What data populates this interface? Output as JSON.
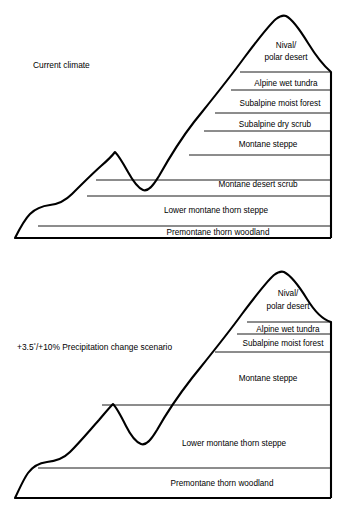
{
  "figure": {
    "type": "schematic-diagram",
    "background_color": "#ffffff",
    "line_color": "#000000",
    "panel_count": 2
  },
  "panels": [
    {
      "id": "current-climate",
      "caption": "Current climate",
      "caption_pos": {
        "x": 33,
        "y": 68
      },
      "peak": {
        "x": 286,
        "y": 16
      },
      "base_y": 238,
      "left_x": 15,
      "right_x": 331,
      "zones": [
        {
          "label": "Nival/",
          "label2": "polar desert",
          "y_top": 16,
          "y_bottom": 72,
          "label_x": 286,
          "label_y": 48,
          "centered": true
        },
        {
          "label": "Alpine wet tundra",
          "y_top": 72,
          "y_bottom": 90,
          "label_x": 286,
          "label_y": 85,
          "centered": true
        },
        {
          "label": "Subalpine moist forest",
          "y_top": 90,
          "y_bottom": 113,
          "label_x": 280,
          "label_y": 105,
          "centered": true
        },
        {
          "label": "Subalpine dry scrub",
          "y_top": 113,
          "y_bottom": 131,
          "label_x": 275,
          "label_y": 126,
          "centered": true
        },
        {
          "label": "Montane steppe",
          "y_top": 131,
          "y_bottom": 155,
          "label_x": 268,
          "label_y": 148,
          "centered": true
        },
        {
          "label": "Montane desert scrub",
          "y_top": 155,
          "y_bottom": 180,
          "label_x": 258,
          "label_y": 186,
          "centered": true
        },
        {
          "label": "Lower montane thorn steppe",
          "y_top": 180,
          "y_bottom": 209,
          "label_x": 220,
          "label_y": 213,
          "centered": true
        },
        {
          "label": "Premontane thorn woodland",
          "y_top": 209,
          "y_bottom": 238,
          "label_x": 220,
          "label_y": 235,
          "centered": true
        }
      ]
    },
    {
      "id": "change-scenario",
      "caption": "+3.5°/+10% Precipitation change scenario",
      "caption_prefix": "+3.5",
      "caption_degree": "°",
      "caption_suffix": "/+10% Precipitation change scenario",
      "caption_pos": {
        "x": 17,
        "y": 350
      },
      "peak": {
        "x": 286,
        "y": 273
      },
      "base_y": 498,
      "left_x": 15,
      "right_x": 331,
      "zones": [
        {
          "label": "Nival/",
          "label2": "polar desert",
          "y_top": 273,
          "y_bottom": 322,
          "label_x": 288,
          "label_y": 303,
          "centered": true
        },
        {
          "label": "Alpine wet tundra",
          "y_top": 322,
          "y_bottom": 334,
          "label_x": 288,
          "label_y": 332,
          "centered": true
        },
        {
          "label": "Subalpine moist forest",
          "y_top": 334,
          "y_bottom": 352,
          "label_x": 283,
          "label_y": 347,
          "centered": true
        },
        {
          "label": "Montane steppe",
          "y_top": 352,
          "y_bottom": 405,
          "label_x": 268,
          "label_y": 381,
          "centered": true
        },
        {
          "label": "Lower montane thorn steppe",
          "y_top": 405,
          "y_bottom": 468,
          "label_x": 238,
          "label_y": 446,
          "centered": true
        },
        {
          "label": "Premontane thorn woodland",
          "y_top": 468,
          "y_bottom": 498,
          "label_x": 225,
          "label_y": 484,
          "centered": true
        }
      ]
    }
  ],
  "zone_names": [
    "Nival/polar desert",
    "Alpine wet tundra",
    "Subalpine moist forest",
    "Subalpine dry scrub",
    "Montane steppe",
    "Montane desert scrub",
    "Lower montane thorn steppe",
    "Premontane thorn woodland"
  ]
}
